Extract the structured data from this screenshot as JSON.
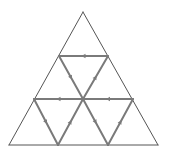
{
  "diagram": {
    "title": "",
    "colors": {
      "background": "#ffffff",
      "outline": "#555555",
      "path": "#7a7a7a",
      "arrow": "#7a7a7a"
    },
    "vertices": {
      "apex": [
        83,
        12
      ],
      "top_left": [
        59,
        56
      ],
      "top_right": [
        108,
        56
      ],
      "mid_left": [
        34,
        99
      ],
      "center": [
        83,
        99
      ],
      "mid_right": [
        133,
        99
      ],
      "bottom_left": [
        9,
        145
      ],
      "bottom_inner_left": [
        58,
        145
      ],
      "bottom_inner_right": [
        108,
        145
      ],
      "bottom_right": [
        158,
        145
      ]
    },
    "outline_edges": [
      [
        "apex",
        "bottom_left"
      ],
      [
        "apex",
        "bottom_right"
      ],
      [
        "bottom_left",
        "bottom_right"
      ]
    ],
    "path_edges": [
      {
        "from": "top_right",
        "to": "top_left",
        "arrow": true
      },
      {
        "from": "top_left",
        "to": "center",
        "arrow": true
      },
      {
        "from": "center",
        "to": "top_right",
        "arrow": true
      },
      {
        "from": "center",
        "to": "mid_left",
        "arrow": true
      },
      {
        "from": "mid_right",
        "to": "center",
        "arrow": true
      },
      {
        "from": "mid_left",
        "to": "bottom_inner_left",
        "arrow": true
      },
      {
        "from": "bottom_inner_left",
        "to": "center",
        "arrow": true
      },
      {
        "from": "center",
        "to": "bottom_inner_right",
        "arrow": true
      },
      {
        "from": "bottom_inner_right",
        "to": "mid_right",
        "arrow": true
      }
    ]
  }
}
